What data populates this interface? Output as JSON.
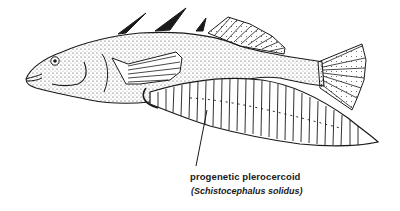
{
  "figure": {
    "label": {
      "primary": "progenetic plerocercoid",
      "secondary": "(Schistocephalus solidus)"
    },
    "colors": {
      "ink": "#1a1a1a",
      "background": "#ffffff",
      "stipple": "#333333"
    }
  }
}
